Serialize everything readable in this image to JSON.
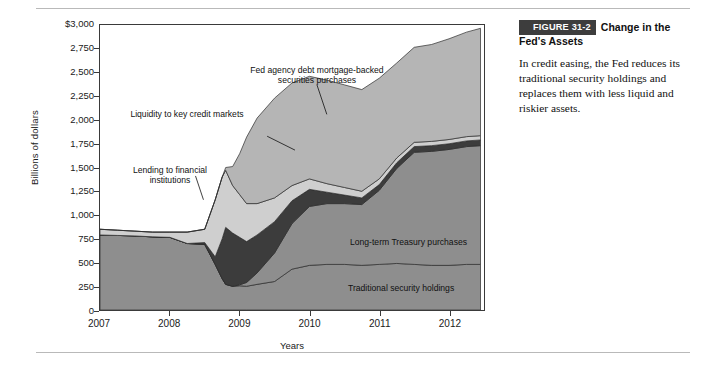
{
  "figure": {
    "number_label": "FIGURE 31-2",
    "title": "Change in the Fed's Assets",
    "body": "In credit easing, the Fed reduces its traditional security holdings and replaces them with less liquid and riskier assets."
  },
  "chart_data": {
    "type": "area",
    "title": "Change in the Fed's Assets",
    "xlabel": "Years",
    "ylabel": "Billions of dollars",
    "xlim": [
      2007.0,
      2012.5
    ],
    "ylim": [
      0,
      3000
    ],
    "grid": false,
    "legend": "in-plot annotations",
    "ytick_labels": [
      "$3,000",
      "2,750",
      "2,500",
      "2,250",
      "2,000",
      "1,750",
      "1,500",
      "1,250",
      "1,000",
      "750",
      "500",
      "250",
      "0"
    ],
    "ytick_values": [
      3000,
      2750,
      2500,
      2250,
      2000,
      1750,
      1500,
      1250,
      1000,
      750,
      500,
      250,
      0
    ],
    "xtick_labels": [
      "2007",
      "2008",
      "2009",
      "2010",
      "2011",
      "2012"
    ],
    "xtick_values": [
      2007,
      2008,
      2009,
      2010,
      2011,
      2012
    ],
    "annotations": [
      {
        "text": "Fed agency debt mortgage-backed securities purchases",
        "x": 2009.6,
        "y": 2500
      },
      {
        "text": "Liquidity to key credit markets",
        "x": 2008.0,
        "y": 2150
      },
      {
        "text": "Lending to financial institutions",
        "x": 2007.75,
        "y": 1400
      },
      {
        "text": "Long-term Treasury purchases",
        "x": 2011.0,
        "y": 680
      },
      {
        "text": "Traditional security holdings",
        "x": 2011.1,
        "y": 250
      }
    ],
    "stacking": "bottom-to-top: Traditional security holdings, Long-term Treasury purchases, Liquidity to key credit markets, Lending to financial institutions, Fed agency debt mortgage-backed securities purchases",
    "x": [
      2007.0,
      2007.25,
      2007.5,
      2007.75,
      2008.0,
      2008.25,
      2008.5,
      2008.65,
      2008.75,
      2008.8,
      2008.9,
      2009.0,
      2009.1,
      2009.25,
      2009.5,
      2009.75,
      2010.0,
      2010.25,
      2010.5,
      2010.75,
      2011.0,
      2011.25,
      2011.5,
      2011.75,
      2012.0,
      2012.25,
      2012.45
    ],
    "series": [
      {
        "name": "Traditional security holdings",
        "color": "#8e8e8e",
        "values": [
          790,
          785,
          780,
          770,
          765,
          700,
          690,
          480,
          330,
          270,
          250,
          255,
          250,
          270,
          300,
          430,
          470,
          480,
          480,
          470,
          480,
          490,
          480,
          470,
          470,
          480,
          480
        ]
      },
      {
        "name": "Long-term Treasury purchases",
        "color": "#8e8e8e",
        "values": [
          0,
          0,
          0,
          0,
          0,
          0,
          0,
          0,
          0,
          0,
          0,
          10,
          40,
          120,
          300,
          480,
          620,
          640,
          640,
          640,
          780,
          1000,
          1180,
          1200,
          1220,
          1240,
          1250
        ]
      },
      {
        "name": "Liquidity to key credit markets",
        "color": "#3c3c3c",
        "values": [
          0,
          0,
          0,
          0,
          0,
          0,
          20,
          80,
          420,
          600,
          560,
          500,
          430,
          400,
          330,
          240,
          180,
          120,
          90,
          70,
          60,
          60,
          60,
          60,
          60,
          60,
          60
        ]
      },
      {
        "name": "Lending to financial institutions",
        "color": "#cfcfcf",
        "values": [
          60,
          55,
          50,
          50,
          55,
          120,
          140,
          600,
          650,
          600,
          500,
          450,
          400,
          330,
          250,
          160,
          110,
          90,
          80,
          70,
          60,
          50,
          45,
          45,
          45,
          45,
          45
        ]
      },
      {
        "name": "Fed agency debt mortgage-backed securities purchases",
        "color": "#b5b5b5",
        "values": [
          0,
          0,
          0,
          0,
          0,
          0,
          0,
          0,
          0,
          30,
          200,
          430,
          700,
          900,
          1050,
          1080,
          1080,
          1090,
          1080,
          1070,
          1060,
          1000,
          1000,
          1020,
          1060,
          1100,
          1130
        ]
      }
    ]
  }
}
